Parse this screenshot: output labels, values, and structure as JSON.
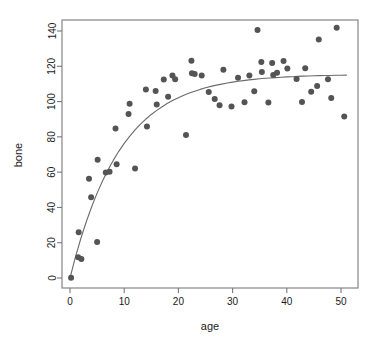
{
  "chart_data": {
    "type": "scatter",
    "title": "",
    "xlabel": "age",
    "ylabel": "bone",
    "xlim": [
      -1.5,
      53.0
    ],
    "ylim": [
      -6.0,
      146.0
    ],
    "grid": false,
    "legend": "none",
    "xticks": [
      0,
      10,
      20,
      30,
      40,
      50
    ],
    "xtick_labels": [
      "0",
      "10",
      "20",
      "30",
      "40",
      "50"
    ],
    "yticks": [
      0,
      20,
      40,
      60,
      80,
      100,
      120,
      140
    ],
    "ytick_labels": [
      "0",
      "20",
      "40",
      "60",
      "80",
      "100",
      "120",
      "140"
    ],
    "point_color": "#545454",
    "point_symbol": "filled-circle",
    "point_size_px": 3.0,
    "curve_color": "#6b6b6b",
    "axis_color": "#7a7a7a",
    "series": [
      {
        "name": "observations",
        "type": "scatter",
        "points": [
          [
            0.2,
            0.2
          ],
          [
            1.5,
            11.8
          ],
          [
            2.1,
            10.7
          ],
          [
            1.6,
            26.0
          ],
          [
            3.5,
            56.2
          ],
          [
            3.9,
            45.8
          ],
          [
            5.0,
            20.4
          ],
          [
            5.1,
            67.0
          ],
          [
            6.6,
            59.8
          ],
          [
            7.3,
            60.2
          ],
          [
            8.4,
            84.8
          ],
          [
            8.6,
            64.5
          ],
          [
            10.8,
            93.0
          ],
          [
            11.0,
            98.8
          ],
          [
            12.0,
            62.1
          ],
          [
            14.0,
            106.8
          ],
          [
            14.2,
            85.8
          ],
          [
            15.8,
            106.0
          ],
          [
            16.0,
            98.3
          ],
          [
            17.3,
            112.5
          ],
          [
            18.1,
            102.8
          ],
          [
            18.9,
            114.8
          ],
          [
            19.4,
            112.6
          ],
          [
            21.4,
            81.0
          ],
          [
            22.4,
            123.2
          ],
          [
            22.5,
            116.0
          ],
          [
            23.0,
            115.6
          ],
          [
            24.3,
            114.8
          ],
          [
            25.6,
            105.4
          ],
          [
            26.7,
            101.5
          ],
          [
            27.6,
            97.9
          ],
          [
            28.3,
            118.0
          ],
          [
            29.8,
            97.2
          ],
          [
            31.0,
            113.5
          ],
          [
            32.2,
            99.6
          ],
          [
            33.1,
            114.8
          ],
          [
            34.0,
            105.8
          ],
          [
            34.6,
            140.5
          ],
          [
            35.3,
            122.4
          ],
          [
            35.4,
            116.8
          ],
          [
            36.6,
            99.5
          ],
          [
            37.3,
            121.8
          ],
          [
            37.5,
            115.0
          ],
          [
            38.2,
            116.4
          ],
          [
            39.4,
            123.0
          ],
          [
            40.1,
            118.8
          ],
          [
            41.8,
            112.8
          ],
          [
            42.8,
            99.8
          ],
          [
            43.4,
            118.9
          ],
          [
            44.5,
            105.6
          ],
          [
            45.6,
            108.8
          ],
          [
            45.9,
            135.2
          ],
          [
            47.6,
            112.6
          ],
          [
            48.2,
            102.0
          ],
          [
            49.2,
            141.8
          ],
          [
            50.6,
            91.6
          ]
        ]
      },
      {
        "name": "fitted-curve",
        "type": "line",
        "model": "asymptotic-growth",
        "asymptote": 115.4,
        "rate": 0.108,
        "points": [
          [
            0.0,
            0.0
          ],
          [
            1.0,
            11.8
          ],
          [
            2.0,
            22.4
          ],
          [
            3.0,
            31.9
          ],
          [
            4.0,
            40.4
          ],
          [
            5.0,
            48.1
          ],
          [
            6.0,
            55.0
          ],
          [
            7.0,
            61.2
          ],
          [
            8.0,
            66.8
          ],
          [
            9.0,
            71.8
          ],
          [
            10.0,
            76.3
          ],
          [
            11.0,
            80.3
          ],
          [
            12.0,
            83.9
          ],
          [
            13.0,
            87.2
          ],
          [
            14.0,
            90.1
          ],
          [
            15.0,
            92.7
          ],
          [
            16.0,
            95.0
          ],
          [
            17.0,
            97.1
          ],
          [
            18.0,
            99.0
          ],
          [
            19.0,
            100.7
          ],
          [
            20.0,
            102.2
          ],
          [
            21.0,
            103.6
          ],
          [
            22.0,
            104.8
          ],
          [
            23.0,
            105.9
          ],
          [
            24.0,
            106.9
          ],
          [
            25.0,
            107.8
          ],
          [
            26.0,
            108.6
          ],
          [
            27.0,
            109.3
          ],
          [
            28.0,
            109.9
          ],
          [
            29.0,
            110.5
          ],
          [
            30.0,
            111.0
          ],
          [
            31.0,
            111.5
          ],
          [
            32.0,
            111.9
          ],
          [
            33.0,
            112.3
          ],
          [
            34.0,
            112.6
          ],
          [
            35.0,
            112.9
          ],
          [
            36.0,
            113.2
          ],
          [
            37.0,
            113.4
          ],
          [
            38.0,
            113.6
          ],
          [
            39.0,
            113.8
          ],
          [
            40.0,
            114.0
          ],
          [
            41.0,
            114.1
          ],
          [
            42.0,
            114.3
          ],
          [
            43.0,
            114.4
          ],
          [
            44.0,
            114.5
          ],
          [
            45.0,
            114.6
          ],
          [
            46.0,
            114.7
          ],
          [
            47.0,
            114.8
          ],
          [
            48.0,
            114.8
          ],
          [
            49.0,
            114.9
          ],
          [
            50.0,
            114.9
          ],
          [
            51.0,
            115.0
          ]
        ]
      }
    ]
  }
}
